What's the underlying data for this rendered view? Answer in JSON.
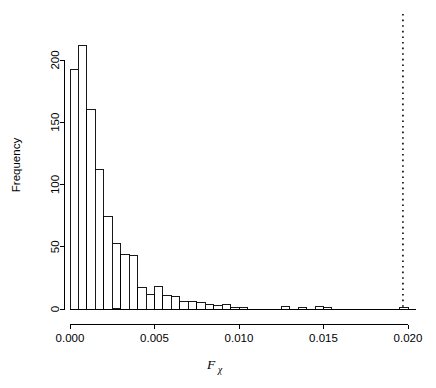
{
  "chart_data": {
    "type": "bar",
    "title": "",
    "subtitle": "",
    "xlabel": "F",
    "xlabel_subscript": "χ",
    "ylabel": "Frequency",
    "grid": false,
    "legend": "none",
    "xlim": [
      0.0,
      0.0205
    ],
    "ylim": [
      0,
      215
    ],
    "xticks": [
      0.0,
      0.005,
      0.01,
      0.015,
      0.02
    ],
    "xtick_labels": [
      "0.000",
      "0.005",
      "0.010",
      "0.015",
      "0.020"
    ],
    "yticks": [
      0,
      50,
      100,
      150,
      200
    ],
    "ytick_labels": [
      "0",
      "50",
      "100",
      "150",
      "200"
    ],
    "bin_width": 0.0005,
    "bin_starts": [
      0.0,
      0.0005,
      0.001,
      0.0015,
      0.002,
      0.0025,
      0.003,
      0.0035,
      0.004,
      0.0045,
      0.005,
      0.0055,
      0.006,
      0.0065,
      0.007,
      0.0075,
      0.008,
      0.0085,
      0.009,
      0.0095,
      0.01,
      0.0105,
      0.011,
      0.0115,
      0.012,
      0.0125,
      0.013,
      0.0135,
      0.014,
      0.0145,
      0.015,
      0.0155,
      0.016,
      0.0165,
      0.017,
      0.0175,
      0.018,
      0.0185,
      0.019,
      0.0195
    ],
    "categories": [
      "0.0000-0.0005",
      "0.0005-0.0010",
      "0.0010-0.0015",
      "0.0015-0.0020",
      "0.0020-0.0025",
      "0.0025-0.0030",
      "0.0030-0.0035",
      "0.0035-0.0040",
      "0.0040-0.0045",
      "0.0045-0.0050",
      "0.0050-0.0055",
      "0.0055-0.0060",
      "0.0060-0.0065",
      "0.0065-0.0070",
      "0.0070-0.0075",
      "0.0075-0.0080",
      "0.0080-0.0085",
      "0.0085-0.0090",
      "0.0090-0.0095",
      "0.0095-0.0100",
      "0.0100-0.0105",
      "0.0105-0.0110",
      "0.0110-0.0115",
      "0.0115-0.0120",
      "0.0120-0.0125",
      "0.0125-0.0130",
      "0.0130-0.0135",
      "0.0135-0.0140",
      "0.0140-0.0145",
      "0.0145-0.0150",
      "0.0150-0.0155",
      "0.0155-0.0160",
      "0.0160-0.0165",
      "0.0165-0.0170",
      "0.0170-0.0175",
      "0.0175-0.0180",
      "0.0180-0.0185",
      "0.0185-0.0190",
      "0.0190-0.0195",
      "0.0195-0.0200"
    ],
    "values": [
      192,
      212,
      160,
      112,
      74,
      53,
      44,
      43,
      17,
      12,
      18,
      11,
      10,
      6,
      6,
      5,
      4,
      3,
      4,
      1,
      1,
      0,
      0,
      0,
      0,
      2,
      0,
      1,
      0,
      2,
      1,
      0,
      0,
      0,
      0,
      0,
      0,
      0,
      0,
      1
    ],
    "annotations": [
      {
        "name": "observed-value-line",
        "style": "dotted-vertical",
        "x": 0.0197,
        "color": "#000000"
      }
    ]
  },
  "colors": {
    "bar_fill": "#ffffff",
    "bar_stroke": "#000000",
    "axis": "#000000",
    "background": "#ffffff",
    "annotation": "#000000"
  }
}
